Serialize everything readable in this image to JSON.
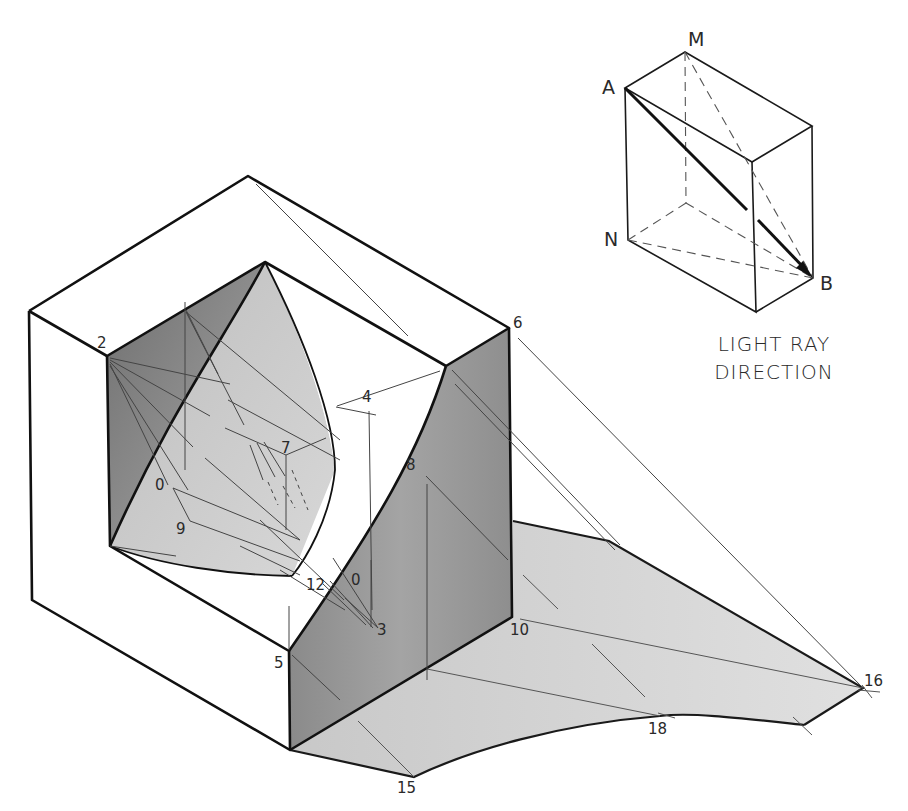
{
  "figure": {
    "caption": {
      "line1": "LIGHT RAY",
      "line2": "DIRECTION"
    },
    "light_box_labels": {
      "a": "A",
      "m": "M",
      "n": "N",
      "b": "B"
    },
    "point_labels": {
      "p0_left": "0",
      "p0_right": "0",
      "p2": "2",
      "p3": "3",
      "p4": "4",
      "p5": "5",
      "p6": "6",
      "p7": "7",
      "p8": "8",
      "p9": "9",
      "p10": "10",
      "p12": "12",
      "p15": "15",
      "p16": "16",
      "p18": "18"
    },
    "colors": {
      "ink": "#1a1a1a",
      "construction": "#555555",
      "shade_dark": "#7a7a7a",
      "shade_mid": "#a8a8a8",
      "shadow_light": "#d2d2d2",
      "paper": "#ffffff"
    }
  }
}
